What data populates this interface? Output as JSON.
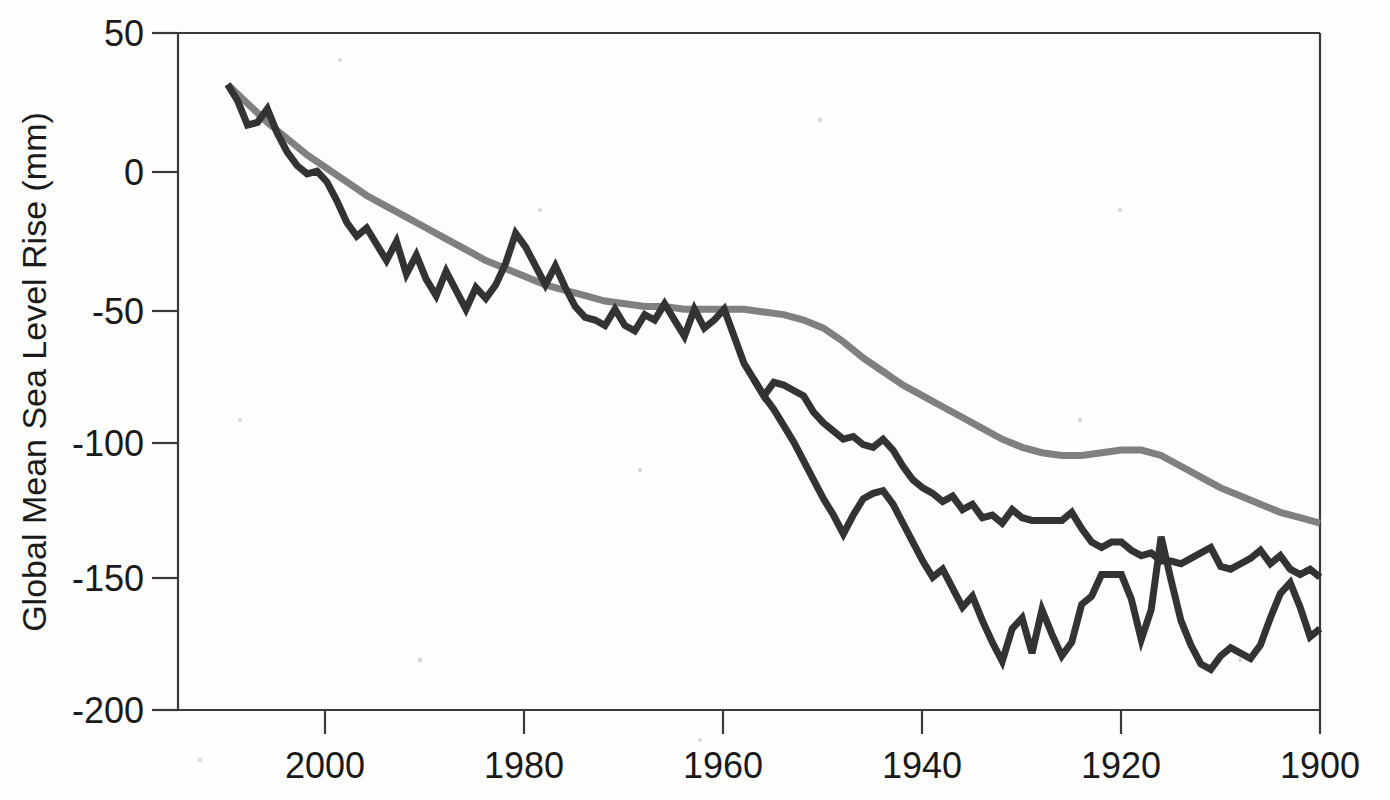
{
  "chart_data": {
    "type": "line",
    "title": "",
    "xlabel": "",
    "ylabel": "Global Mean Sea Level Rise (mm)",
    "xlim": [
      2015,
      1900
    ],
    "ylim": [
      -200,
      50
    ],
    "x_reversed": true,
    "grid": false,
    "legend": "none",
    "xticks": [
      2000,
      1980,
      1960,
      1940,
      1920,
      1900
    ],
    "xtick_labels": [
      "2000",
      "1980",
      "1960",
      "1940",
      "1920",
      "1900"
    ],
    "yticks": [
      50,
      0,
      -50,
      -100,
      -150,
      -200
    ],
    "ytick_labels": [
      "50",
      "0",
      "-50",
      "-100",
      "-150",
      "-200"
    ],
    "series": [
      {
        "name": "smoothed-trend",
        "color": "#808080",
        "width": 7,
        "x": [
          2010,
          2008,
          2006,
          2004,
          2002,
          2000,
          1998,
          1996,
          1994,
          1992,
          1990,
          1988,
          1986,
          1984,
          1982,
          1980,
          1978,
          1976,
          1974,
          1972,
          1970,
          1968,
          1966,
          1964,
          1962,
          1960,
          1958,
          1956,
          1954,
          1952,
          1950,
          1948,
          1946,
          1944,
          1942,
          1940,
          1938,
          1936,
          1934,
          1932,
          1930,
          1928,
          1926,
          1924,
          1922,
          1920,
          1918,
          1916,
          1914,
          1912,
          1910,
          1908,
          1906,
          1904,
          1902,
          1900
        ],
        "values": [
          31,
          24,
          17,
          11,
          5,
          0,
          -5,
          -10,
          -14,
          -18,
          -22,
          -26,
          -30,
          -34,
          -37,
          -40,
          -43,
          -45,
          -47,
          -49,
          -50,
          -51,
          -51,
          -52,
          -52,
          -52,
          -52,
          -53,
          -54,
          -56,
          -59,
          -64,
          -70,
          -75,
          -80,
          -84,
          -88,
          -92,
          -96,
          -100,
          -103,
          -105,
          -106,
          -106,
          -105,
          -104,
          -104,
          -106,
          -110,
          -114,
          -118,
          -121,
          -124,
          -127,
          -129,
          -131
        ]
      },
      {
        "name": "reconstruction-upper",
        "color": "#333333",
        "width": 7,
        "x": [
          2010,
          2009,
          2008,
          2007,
          2006,
          2005,
          2004,
          2003,
          2002,
          2001,
          2000,
          1999,
          1998,
          1997,
          1996,
          1995,
          1994,
          1993,
          1992,
          1991,
          1990,
          1989,
          1988,
          1987,
          1986,
          1985,
          1984,
          1983,
          1982,
          1981,
          1980,
          1979,
          1978,
          1977,
          1976,
          1975,
          1974,
          1973,
          1972,
          1971,
          1970,
          1969,
          1968,
          1967,
          1966,
          1965,
          1964,
          1963,
          1962,
          1961,
          1960,
          1959,
          1958,
          1957,
          1956,
          1955,
          1954,
          1953,
          1952,
          1951,
          1950,
          1949,
          1948,
          1947,
          1946,
          1945,
          1944,
          1943,
          1942,
          1941,
          1940,
          1939,
          1938,
          1937,
          1936,
          1935,
          1934,
          1933,
          1932,
          1931,
          1930,
          1929,
          1928,
          1927,
          1926,
          1925,
          1924,
          1923,
          1922,
          1921,
          1920,
          1919,
          1918,
          1917,
          1916,
          1915,
          1914,
          1913,
          1912,
          1911,
          1910,
          1909,
          1908,
          1907,
          1906,
          1905,
          1904,
          1903,
          1902,
          1901,
          1900
        ],
        "values": [
          31,
          25,
          16,
          17,
          22,
          13,
          6,
          1,
          -2,
          -1,
          -5,
          -12,
          -20,
          -25,
          -22,
          -28,
          -34,
          -27,
          -39,
          -32,
          -41,
          -47,
          -38,
          -45,
          -52,
          -44,
          -48,
          -43,
          -35,
          -24,
          -29,
          -36,
          -43,
          -36,
          -44,
          -51,
          -55,
          -56,
          -58,
          -52,
          -58,
          -60,
          -54,
          -56,
          -50,
          -56,
          -62,
          -52,
          -59,
          -56,
          -52,
          -62,
          -72,
          -78,
          -84,
          -79,
          -80,
          -82,
          -84,
          -90,
          -94,
          -97,
          -100,
          -99,
          -102,
          -103,
          -100,
          -104,
          -110,
          -115,
          -118,
          -120,
          -123,
          -121,
          -126,
          -124,
          -129,
          -128,
          -131,
          -126,
          -129,
          -130,
          -130,
          -130,
          -130,
          -127,
          -133,
          -138,
          -140,
          -138,
          -138,
          -141,
          -143,
          -142,
          -145,
          -145,
          -146,
          -144,
          -142,
          -140,
          -147,
          -148,
          -146,
          -144,
          -141,
          -146,
          -143,
          -148,
          -150,
          -148,
          -151
        ]
      },
      {
        "name": "reconstruction-lower",
        "color": "#333333",
        "width": 7,
        "x": [
          1957,
          1956,
          1955,
          1954,
          1953,
          1952,
          1951,
          1950,
          1949,
          1948,
          1947,
          1946,
          1945,
          1944,
          1943,
          1942,
          1941,
          1940,
          1939,
          1938,
          1937,
          1936,
          1935,
          1934,
          1933,
          1932,
          1931,
          1930,
          1929,
          1928,
          1927,
          1926,
          1925,
          1924,
          1923,
          1922,
          1921,
          1920,
          1919,
          1918,
          1917,
          1916,
          1915,
          1914,
          1913,
          1912,
          1911,
          1910,
          1909,
          1908,
          1907,
          1906,
          1905,
          1904,
          1903,
          1902,
          1901,
          1900
        ],
        "values": [
          -78,
          -84,
          -89,
          -95,
          -101,
          -108,
          -115,
          -122,
          -128,
          -135,
          -128,
          -122,
          -120,
          -119,
          -124,
          -131,
          -138,
          -145,
          -151,
          -148,
          -155,
          -162,
          -158,
          -167,
          -175,
          -182,
          -170,
          -166,
          -179,
          -163,
          -172,
          -180,
          -175,
          -161,
          -158,
          -150,
          -150,
          -150,
          -159,
          -174,
          -163,
          -136,
          -152,
          -167,
          -176,
          -183,
          -185,
          -180,
          -177,
          -179,
          -181,
          -176,
          -166,
          -157,
          -153,
          -162,
          -173,
          -170
        ]
      }
    ]
  },
  "axes": {
    "y_title": "Global Mean Sea Level Rise (mm)"
  }
}
